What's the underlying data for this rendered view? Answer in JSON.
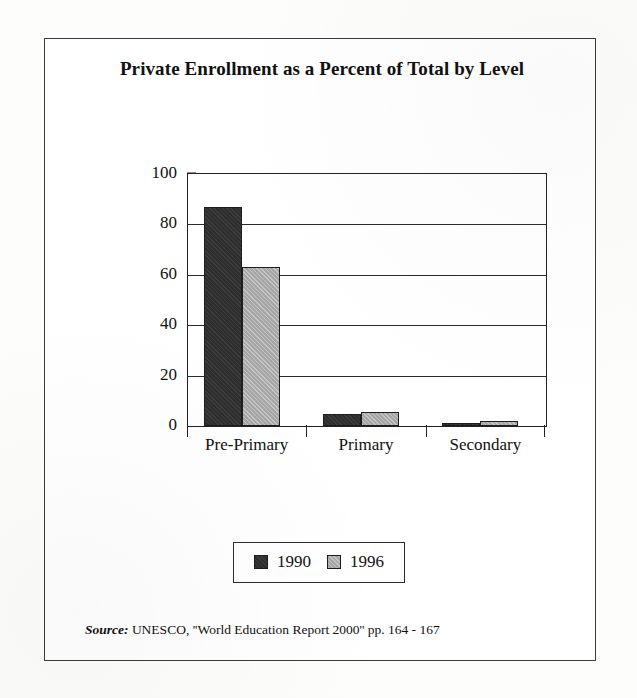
{
  "figure": {
    "title": "Private Enrollment as a Percent of Total by Level",
    "source_label": "Source:",
    "source_text": "UNESCO, ''World Education Report 2000'' pp. 164 - 167"
  },
  "colors": {
    "series_1990": "#2e2e2e",
    "series_1996": "#a6a6a6",
    "axis": "#222222",
    "frame": "#3a3a3a",
    "background": "#ffffff"
  },
  "chart_data": {
    "type": "bar",
    "title": "Private Enrollment as a Percent of Total by Level",
    "xlabel": "",
    "ylabel": "Percentage",
    "categories": [
      "Pre-Primary",
      "Primary",
      "Secondary"
    ],
    "series": [
      {
        "name": "1990",
        "values": [
          87,
          4.8,
          1.3
        ]
      },
      {
        "name": "1996",
        "values": [
          63,
          5.6,
          1.8
        ]
      }
    ],
    "ylim": [
      0,
      100
    ],
    "yticks": [
      0,
      20,
      40,
      60,
      80,
      100
    ],
    "ytick_labels": [
      "0",
      "20",
      "40",
      "60",
      "80",
      "100"
    ],
    "grid": true,
    "grid_axis": "y",
    "legend": {
      "position": "bottom",
      "entries": [
        "1990",
        "1996"
      ]
    }
  }
}
